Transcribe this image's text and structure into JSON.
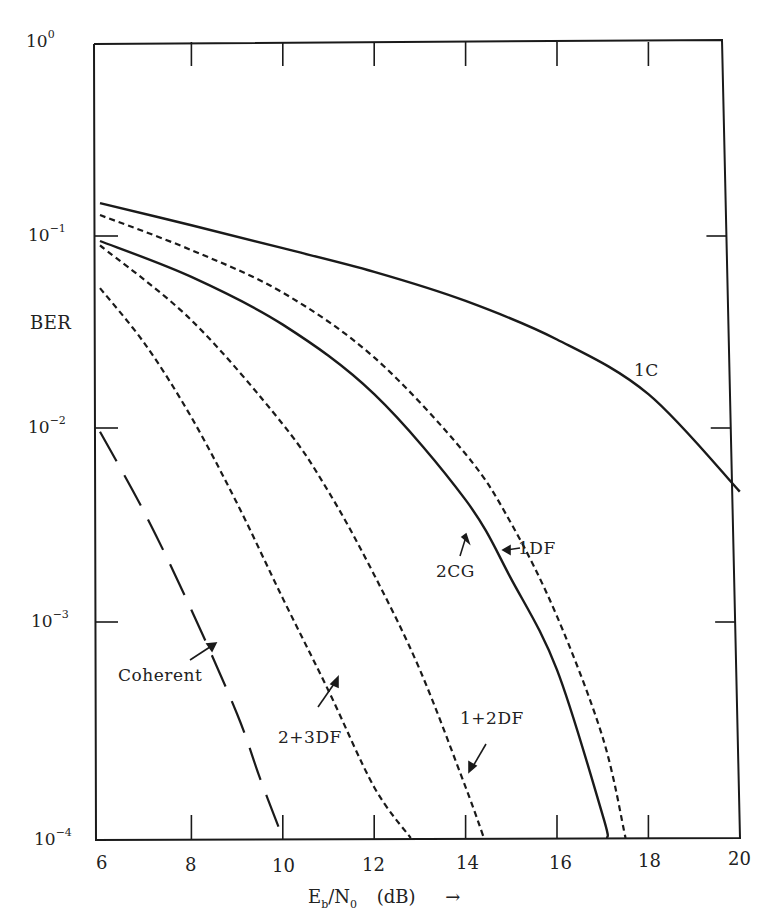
{
  "chart_data": {
    "type": "line",
    "title": "",
    "xlabel": "Eb/N0 (dB)",
    "ylabel": "BER",
    "xlim": [
      6,
      20
    ],
    "ylim": [
      0.0001,
      1
    ],
    "yscale": "log",
    "grid": false,
    "x_ticks": [
      6,
      8,
      10,
      12,
      14,
      16,
      18,
      20
    ],
    "y_ticks": [
      "10^0",
      "10^-1",
      "10^-2",
      "10^-3",
      "10^-4"
    ],
    "legend": "inline annotations",
    "series": [
      {
        "name": "1C",
        "style": "solid",
        "x": [
          6,
          8,
          10,
          12,
          14,
          16,
          18,
          20
        ],
        "y": [
          0.155,
          0.12,
          0.092,
          0.07,
          0.05,
          0.032,
          0.017,
          0.0055
        ]
      },
      {
        "name": "1DF",
        "style": "dashed",
        "x": [
          6,
          8,
          10,
          12,
          14,
          15,
          16,
          17,
          17.5
        ],
        "y": [
          0.135,
          0.09,
          0.055,
          0.026,
          0.0085,
          0.0038,
          0.0013,
          0.00032,
          0.0001
        ]
      },
      {
        "name": "2CG",
        "style": "solid",
        "x": [
          6,
          8,
          10,
          12,
          14,
          15,
          16,
          17,
          17.1
        ],
        "y": [
          0.1,
          0.066,
          0.038,
          0.017,
          0.005,
          0.002,
          0.0007,
          0.00013,
          0.0001
        ]
      },
      {
        "name": "1+2DF",
        "style": "dashed",
        "x": [
          6,
          8,
          10,
          11,
          12,
          13,
          14,
          14.4
        ],
        "y": [
          0.095,
          0.04,
          0.012,
          0.0055,
          0.0021,
          0.0007,
          0.00018,
          0.0001
        ]
      },
      {
        "name": "2+3DF",
        "style": "dashed",
        "x": [
          6,
          7,
          8,
          9,
          10,
          11,
          12,
          12.8
        ],
        "y": [
          0.058,
          0.03,
          0.013,
          0.0048,
          0.0016,
          0.00055,
          0.00018,
          0.0001
        ]
      },
      {
        "name": "Coherent",
        "style": "long-dashed",
        "x": [
          6,
          7,
          8,
          9,
          9.5,
          10
        ],
        "y": [
          0.011,
          0.0042,
          0.0014,
          0.00042,
          0.0002,
          0.0001
        ]
      }
    ],
    "annotations": [
      "1C",
      "1DF",
      "2CG",
      "1+2DF",
      "2+3DF",
      "Coherent"
    ]
  },
  "axes": {
    "y_tick_labels": [
      {
        "base": "10",
        "exp": "0"
      },
      {
        "base": "10",
        "exp": "−1"
      },
      {
        "base": "10",
        "exp": "−2"
      },
      {
        "base": "10",
        "exp": "−3"
      },
      {
        "base": "10",
        "exp": "−4"
      }
    ],
    "x_tick_labels": [
      "6",
      "8",
      "10",
      "12",
      "14",
      "16",
      "18",
      "20"
    ],
    "ylabel": "BER",
    "xlabel_E": "E",
    "xlabel_b": "b",
    "xlabel_N": "N",
    "xlabel_0": "0",
    "xlabel_unit": "(dB)",
    "xlabel_arrow": "→"
  },
  "labels": {
    "c1": "1C",
    "df1": "1DF",
    "cg2": "2CG",
    "df12": "1+2DF",
    "df23": "2+3DF",
    "coherent": "Coherent"
  }
}
